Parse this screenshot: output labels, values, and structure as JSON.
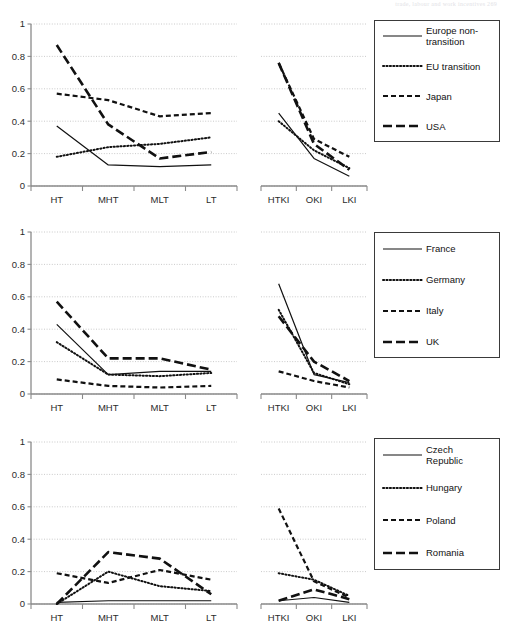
{
  "running_head": "trade, labour and work incentives      269",
  "axis": {
    "y_ticks": [
      "0",
      "0.2",
      "0.4",
      "0.6",
      "0.8",
      "1"
    ],
    "y_values": [
      0,
      0.2,
      0.4,
      0.6,
      0.8,
      1
    ],
    "ylim": [
      0,
      1
    ],
    "grid": true
  },
  "figures": [
    {
      "id": "figure-1",
      "legend": {
        "position": "right",
        "items": [
          {
            "label": "Europe non-\ntransition",
            "style": "solid"
          },
          {
            "label": "EU transition",
            "style": "dotted"
          },
          {
            "label": "Japan",
            "style": "dashed"
          },
          {
            "label": "USA",
            "style": "longdash"
          }
        ]
      },
      "panels": [
        {
          "id": "figure-1-panel-left",
          "categories": [
            "HT",
            "MHT",
            "MLT",
            "LT"
          ],
          "series": [
            {
              "name": "Europe non-transition",
              "style": "solid",
              "values": [
                0.37,
                0.13,
                0.12,
                0.13
              ]
            },
            {
              "name": "EU transition",
              "style": "dotted",
              "values": [
                0.18,
                0.24,
                0.26,
                0.3
              ]
            },
            {
              "name": "Japan",
              "style": "dashed",
              "values": [
                0.57,
                0.53,
                0.43,
                0.45
              ]
            },
            {
              "name": "USA",
              "style": "longdash",
              "values": [
                0.87,
                0.38,
                0.17,
                0.21
              ]
            }
          ]
        },
        {
          "id": "figure-1-panel-right",
          "categories": [
            "HTKI",
            "OKI",
            "LKI"
          ],
          "series": [
            {
              "name": "Europe non-transition",
              "style": "solid",
              "values": [
                0.45,
                0.17,
                0.06
              ]
            },
            {
              "name": "EU transition",
              "style": "dotted",
              "values": [
                0.4,
                0.22,
                0.11
              ]
            },
            {
              "name": "Japan",
              "style": "dashed",
              "values": [
                0.76,
                0.29,
                0.18
              ]
            },
            {
              "name": "USA",
              "style": "longdash",
              "values": [
                0.76,
                0.26,
                0.1
              ]
            }
          ]
        }
      ]
    },
    {
      "id": "figure-2",
      "legend": {
        "position": "right",
        "items": [
          {
            "label": "France",
            "style": "solid"
          },
          {
            "label": "Germany",
            "style": "dotted"
          },
          {
            "label": "Italy",
            "style": "dashed"
          },
          {
            "label": "UK",
            "style": "longdash"
          }
        ]
      },
      "panels": [
        {
          "id": "figure-2-panel-left",
          "categories": [
            "HT",
            "MHT",
            "MLT",
            "LT"
          ],
          "series": [
            {
              "name": "France",
              "style": "solid",
              "values": [
                0.43,
                0.12,
                0.14,
                0.14
              ]
            },
            {
              "name": "Germany",
              "style": "dotted",
              "values": [
                0.32,
                0.12,
                0.11,
                0.13
              ]
            },
            {
              "name": "Italy",
              "style": "dashed",
              "values": [
                0.09,
                0.05,
                0.04,
                0.05
              ]
            },
            {
              "name": "UK",
              "style": "longdash",
              "values": [
                0.57,
                0.22,
                0.22,
                0.15
              ]
            }
          ]
        },
        {
          "id": "figure-2-panel-right",
          "categories": [
            "HTKI",
            "OKI",
            "LKI"
          ],
          "series": [
            {
              "name": "France",
              "style": "solid",
              "values": [
                0.68,
                0.12,
                0.07
              ]
            },
            {
              "name": "Germany",
              "style": "dotted",
              "values": [
                0.52,
                0.13,
                0.06
              ]
            },
            {
              "name": "Italy",
              "style": "dashed",
              "values": [
                0.14,
                0.08,
                0.04
              ]
            },
            {
              "name": "UK",
              "style": "longdash",
              "values": [
                0.48,
                0.2,
                0.08
              ]
            }
          ]
        }
      ]
    },
    {
      "id": "figure-3",
      "legend": {
        "position": "right",
        "items": [
          {
            "label": "Czech\nRepublic",
            "style": "solid"
          },
          {
            "label": "Hungary",
            "style": "dotted"
          },
          {
            "label": "Poland",
            "style": "dashed"
          },
          {
            "label": "Romania",
            "style": "longdash"
          }
        ]
      },
      "panels": [
        {
          "id": "figure-3-panel-left",
          "categories": [
            "HT",
            "MHT",
            "MLT",
            "LT"
          ],
          "series": [
            {
              "name": "Czech Republic",
              "style": "solid",
              "values": [
                0.01,
                0.02,
                0.02,
                0.02
              ]
            },
            {
              "name": "Hungary",
              "style": "dotted",
              "values": [
                0.0,
                0.2,
                0.11,
                0.08
              ]
            },
            {
              "name": "Poland",
              "style": "dashed",
              "values": [
                0.19,
                0.13,
                0.21,
                0.15
              ]
            },
            {
              "name": "Romania",
              "style": "longdash",
              "values": [
                0.0,
                0.32,
                0.28,
                0.06
              ]
            }
          ]
        },
        {
          "id": "figure-3-panel-right",
          "categories": [
            "HTKI",
            "OKI",
            "LKI"
          ],
          "series": [
            {
              "name": "Czech Republic",
              "style": "solid",
              "values": [
                0.02,
                0.04,
                0.01
              ]
            },
            {
              "name": "Hungary",
              "style": "dotted",
              "values": [
                0.19,
                0.15,
                0.05
              ]
            },
            {
              "name": "Poland",
              "style": "dashed",
              "values": [
                0.59,
                0.14,
                0.04
              ]
            },
            {
              "name": "Romania",
              "style": "longdash",
              "values": [
                0.02,
                0.09,
                0.03
              ]
            }
          ]
        }
      ]
    }
  ],
  "chart_data": [
    {
      "type": "line",
      "title": "",
      "xlabel": "",
      "ylabel": "",
      "ylim": [
        0,
        1
      ],
      "grid": true,
      "legend_position": "right",
      "panel": "left",
      "categories": [
        "HT",
        "MHT",
        "MLT",
        "LT"
      ],
      "series": [
        {
          "name": "Europe non-transition",
          "values": [
            0.37,
            0.13,
            0.12,
            0.13
          ]
        },
        {
          "name": "EU transition",
          "values": [
            0.18,
            0.24,
            0.26,
            0.3
          ]
        },
        {
          "name": "Japan",
          "values": [
            0.57,
            0.53,
            0.43,
            0.45
          ]
        },
        {
          "name": "USA",
          "values": [
            0.87,
            0.38,
            0.17,
            0.21
          ]
        }
      ]
    },
    {
      "type": "line",
      "ylim": [
        0,
        1
      ],
      "grid": true,
      "panel": "right",
      "categories": [
        "HTKI",
        "OKI",
        "LKI"
      ],
      "series": [
        {
          "name": "Europe non-transition",
          "values": [
            0.45,
            0.17,
            0.06
          ]
        },
        {
          "name": "EU transition",
          "values": [
            0.4,
            0.22,
            0.11
          ]
        },
        {
          "name": "Japan",
          "values": [
            0.76,
            0.29,
            0.18
          ]
        },
        {
          "name": "USA",
          "values": [
            0.76,
            0.26,
            0.1
          ]
        }
      ]
    },
    {
      "type": "line",
      "ylim": [
        0,
        1
      ],
      "grid": true,
      "panel": "left",
      "categories": [
        "HT",
        "MHT",
        "MLT",
        "LT"
      ],
      "series": [
        {
          "name": "France",
          "values": [
            0.43,
            0.12,
            0.14,
            0.14
          ]
        },
        {
          "name": "Germany",
          "values": [
            0.32,
            0.12,
            0.11,
            0.13
          ]
        },
        {
          "name": "Italy",
          "values": [
            0.09,
            0.05,
            0.04,
            0.05
          ]
        },
        {
          "name": "UK",
          "values": [
            0.57,
            0.22,
            0.22,
            0.15
          ]
        }
      ]
    },
    {
      "type": "line",
      "ylim": [
        0,
        1
      ],
      "grid": true,
      "panel": "right",
      "categories": [
        "HTKI",
        "OKI",
        "LKI"
      ],
      "series": [
        {
          "name": "France",
          "values": [
            0.68,
            0.12,
            0.07
          ]
        },
        {
          "name": "Germany",
          "values": [
            0.52,
            0.13,
            0.06
          ]
        },
        {
          "name": "Italy",
          "values": [
            0.14,
            0.08,
            0.04
          ]
        },
        {
          "name": "UK",
          "values": [
            0.48,
            0.2,
            0.08
          ]
        }
      ]
    },
    {
      "type": "line",
      "ylim": [
        0,
        1
      ],
      "grid": true,
      "panel": "left",
      "categories": [
        "HT",
        "MHT",
        "MLT",
        "LT"
      ],
      "series": [
        {
          "name": "Czech Republic",
          "values": [
            0.01,
            0.02,
            0.02,
            0.02
          ]
        },
        {
          "name": "Hungary",
          "values": [
            0.0,
            0.2,
            0.11,
            0.08
          ]
        },
        {
          "name": "Poland",
          "values": [
            0.19,
            0.13,
            0.21,
            0.15
          ]
        },
        {
          "name": "Romania",
          "values": [
            0.0,
            0.32,
            0.28,
            0.06
          ]
        }
      ]
    },
    {
      "type": "line",
      "ylim": [
        0,
        1
      ],
      "grid": true,
      "panel": "right",
      "categories": [
        "HTKI",
        "OKI",
        "LKI"
      ],
      "series": [
        {
          "name": "Czech Republic",
          "values": [
            0.02,
            0.04,
            0.01
          ]
        },
        {
          "name": "Hungary",
          "values": [
            0.19,
            0.15,
            0.05
          ]
        },
        {
          "name": "Poland",
          "values": [
            0.59,
            0.14,
            0.04
          ]
        },
        {
          "name": "Romania",
          "values": [
            0.02,
            0.09,
            0.03
          ]
        }
      ]
    }
  ]
}
